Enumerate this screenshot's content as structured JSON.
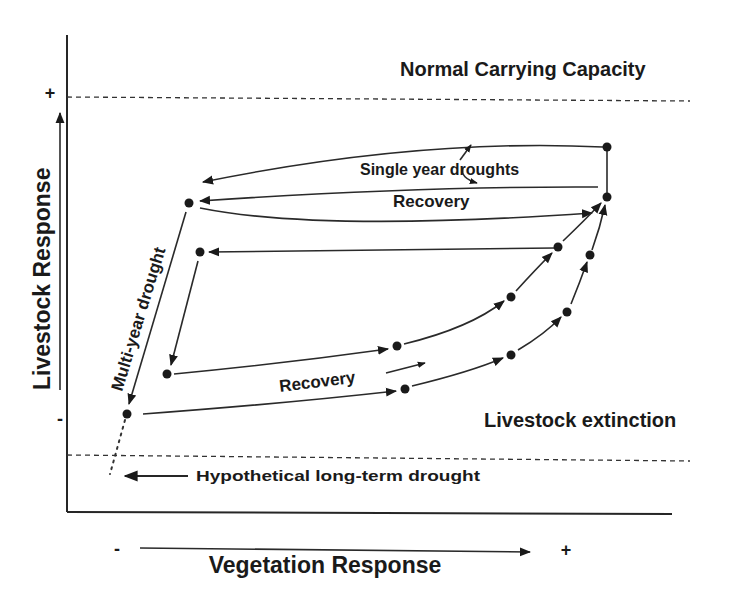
{
  "diagram": {
    "type": "state-transition-diagram",
    "y_axis": {
      "label": "Livestock Response",
      "plus": "+",
      "minus": "-"
    },
    "x_axis": {
      "label": "Vegetation Response",
      "plus": "+",
      "minus": "-"
    },
    "thresholds": {
      "upper": "Normal Carrying Capacity",
      "lower": "Livestock extinction"
    },
    "annotations": {
      "single_year": "Single year droughts",
      "recovery_top": "Recovery",
      "multi_year": "Multi-year drought",
      "recovery_bottom": "Recovery",
      "hypothetical": "Hypothetical long-term drought"
    },
    "colors": {
      "ink": "#1a1a1a",
      "background": "#ffffff"
    }
  }
}
